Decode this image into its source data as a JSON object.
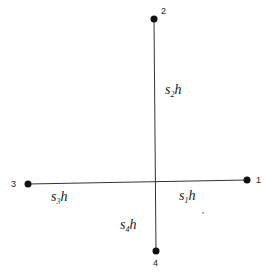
{
  "diagram": {
    "center": {
      "x": 156,
      "y": 181
    },
    "nodes": [
      {
        "id": "1",
        "label": "1",
        "x": 247,
        "y": 180
      },
      {
        "id": "2",
        "label": "2",
        "x": 154,
        "y": 19
      },
      {
        "id": "3",
        "label": "3",
        "x": 28,
        "y": 184
      },
      {
        "id": "4",
        "label": "4",
        "x": 156,
        "y": 251
      }
    ],
    "edges": [
      {
        "from": "center",
        "to": "1",
        "label": {
          "var": "s",
          "sub": "1",
          "tail": "h"
        }
      },
      {
        "from": "center",
        "to": "2",
        "label": {
          "var": "s",
          "sub": "2",
          "tail": "h"
        }
      },
      {
        "from": "center",
        "to": "3",
        "label": {
          "var": "s",
          "sub": "3",
          "tail": "h"
        }
      },
      {
        "from": "center",
        "to": "4",
        "label": {
          "var": "s",
          "sub": "4",
          "tail": "h"
        }
      }
    ],
    "colors": {
      "line": "#333333",
      "node": "#111111",
      "background": "#ffffff"
    }
  }
}
